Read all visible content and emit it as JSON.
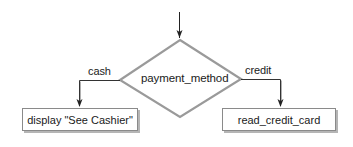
{
  "diagram": {
    "type": "flowchart-decision",
    "decision": {
      "label": "payment_method"
    },
    "branches": [
      {
        "condition": "cash",
        "action": "display \"See Cashier\""
      },
      {
        "condition": "credit",
        "action": "read_credit_card"
      }
    ],
    "colors": {
      "diamond_stroke": "#9a9a9a",
      "arrow_stroke": "#222222",
      "box_border": "#8a8a8a",
      "box_shadow": "#b5b5b5",
      "text": "#1a1a1a"
    }
  }
}
